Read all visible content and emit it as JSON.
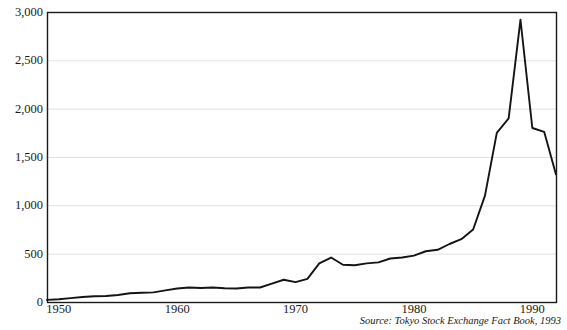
{
  "chart_data": {
    "type": "line",
    "title": "",
    "subtitle": "",
    "xlabel": "",
    "ylabel": "",
    "grid": "horizontal",
    "legend": "none",
    "xlim": [
      1949,
      1992
    ],
    "ylim": [
      0,
      3000
    ],
    "ytick_values": [
      0,
      500,
      1000,
      1500,
      2000,
      2500,
      3000
    ],
    "ytick_labels": [
      "0",
      "500",
      "1,000",
      "1,500",
      "2,000",
      "2,500",
      "3,000"
    ],
    "xtick_values": [
      1950,
      1960,
      1970,
      1980,
      1990
    ],
    "xtick_labels": [
      "1950",
      "1960",
      "1970",
      "1980",
      "1990"
    ],
    "series": [
      {
        "name": "Tokyo Stock Exchange index",
        "color": "#141414",
        "x": [
          1949,
          1950,
          1951,
          1952,
          1953,
          1954,
          1955,
          1956,
          1957,
          1958,
          1959,
          1960,
          1961,
          1962,
          1963,
          1964,
          1965,
          1966,
          1967,
          1968,
          1969,
          1970,
          1971,
          1972,
          1973,
          1974,
          1975,
          1976,
          1977,
          1978,
          1979,
          1980,
          1981,
          1982,
          1983,
          1984,
          1985,
          1986,
          1987,
          1988,
          1989,
          1990,
          1991,
          1992
        ],
        "values": [
          22,
          28,
          40,
          52,
          60,
          62,
          72,
          90,
          95,
          100,
          120,
          140,
          150,
          145,
          150,
          143,
          140,
          150,
          150,
          190,
          230,
          205,
          240,
          400,
          460,
          385,
          380,
          400,
          410,
          450,
          460,
          480,
          525,
          540,
          600,
          650,
          750,
          1100,
          1750,
          1900,
          2920,
          1800,
          1760,
          1320
        ]
      }
    ],
    "annotations": [
      {
        "name": "source-note",
        "text": "Source: Tokyo Stock Exchange Fact Book, 1993"
      }
    ]
  },
  "axes": {
    "y_labels": [
      "3,000",
      "2,500",
      "2,000",
      "1,500",
      "1,000",
      "500",
      "0"
    ],
    "x_labels": [
      "1950",
      "1960",
      "1970",
      "1980",
      "1990"
    ]
  },
  "colors": {
    "line": "#141414",
    "frame": "#1a1a1a",
    "grid": "#e2e2e2",
    "background": "#ffffff",
    "text": "#1a1a1a"
  },
  "source": {
    "text": "Source: Tokyo Stock Exchange Fact Book, 1993"
  }
}
